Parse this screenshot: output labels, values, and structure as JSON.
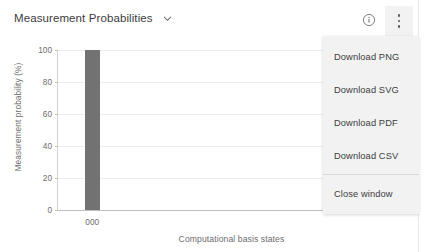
{
  "header": {
    "title": "Measurement Probabilities",
    "chevron_icon": "chevron-down-icon",
    "info_icon": "info-circle-icon",
    "info_glyph": "i",
    "kebab_icon": "kebab-menu-icon"
  },
  "menu": {
    "items": [
      {
        "label": "Download PNG",
        "name": "menu-item-download-png"
      },
      {
        "label": "Download SVG",
        "name": "menu-item-download-svg"
      },
      {
        "label": "Download PDF",
        "name": "menu-item-download-pdf"
      },
      {
        "label": "Download CSV",
        "name": "menu-item-download-csv"
      },
      {
        "label": "Close window",
        "name": "menu-item-close-window"
      }
    ],
    "divider_before_index": 4
  },
  "colors": {
    "bar": "#727272",
    "grid": "#ededed",
    "axis": "#bdbdbd",
    "menu_bg": "#f2f2f2",
    "text": "#3c3c3c",
    "tick_text": "#6d6d6d"
  },
  "chart_data": {
    "type": "bar",
    "title": "Measurement Probabilities",
    "xlabel": "Computational basis states",
    "ylabel": "Measurement probability (%)",
    "categories": [
      "000"
    ],
    "values": [
      100
    ],
    "ylim": [
      0,
      100
    ],
    "yticks": [
      0,
      20,
      40,
      60,
      80,
      100
    ],
    "ytick_labels": [
      "0",
      "20",
      "40",
      "60",
      "80",
      "100"
    ],
    "grid": "horizontal",
    "legend": "none"
  }
}
